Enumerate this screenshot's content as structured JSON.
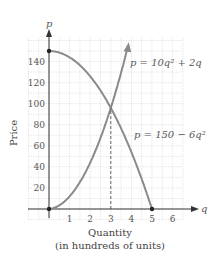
{
  "chart_data": {
    "type": "line",
    "title": "",
    "xlabel": "Quantity",
    "xlabel_sub": "(in hundreds of units)",
    "ylabel": "Price",
    "x_axis_symbol": "q",
    "y_axis_symbol": "p",
    "xlim": [
      0,
      6.5
    ],
    "ylim": [
      0,
      160
    ],
    "x_ticks": [
      1,
      2,
      3,
      4,
      5,
      6
    ],
    "y_ticks": [
      20,
      40,
      60,
      80,
      100,
      120,
      140
    ],
    "grid": true,
    "series": [
      {
        "name": "supply",
        "equation_label": "p = 10q² + 2q",
        "x": [
          0,
          0.5,
          1,
          1.5,
          2,
          2.5,
          3,
          3.5,
          3.8
        ],
        "values": [
          0,
          3.5,
          12,
          25.5,
          44,
          67.5,
          96,
          129.5,
          152
        ],
        "ends_with_arrow": true
      },
      {
        "name": "demand",
        "equation_label": "p = 150 − 6q²",
        "x": [
          0,
          0.5,
          1,
          1.5,
          2,
          2.5,
          3,
          3.5,
          4,
          4.5,
          5
        ],
        "values": [
          150,
          148.5,
          144,
          136.5,
          126,
          112.5,
          96,
          76.5,
          54,
          28.5,
          0
        ]
      }
    ],
    "annotations": [
      {
        "type": "dashed-vertical",
        "x": 3,
        "from_y": 0,
        "to_y": 96,
        "note": "equilibrium quantity"
      },
      {
        "type": "point",
        "x": 0,
        "y": 0
      },
      {
        "type": "point",
        "x": 0,
        "y": 150
      },
      {
        "type": "point",
        "x": 5,
        "y": 0
      }
    ],
    "equilibrium": {
      "q": 3,
      "p": 96
    },
    "colors": {
      "curve": "#8a8a8a",
      "axis": "#333333",
      "grid": "#d8d8d8",
      "text": "#555555"
    }
  },
  "labels": {
    "y_axis_symbol": "p",
    "x_axis_symbol": "q",
    "ylabel": "Price",
    "xlabel": "Quantity",
    "xlabel_sub": "(in hundreds of units)",
    "supply_eq": "p = 10q² + 2q",
    "demand_eq": "p = 150 − 6q²",
    "x_ticks": [
      "1",
      "2",
      "3",
      "4",
      "5",
      "6"
    ],
    "y_ticks": [
      "20",
      "40",
      "60",
      "80",
      "100",
      "120",
      "140"
    ]
  }
}
